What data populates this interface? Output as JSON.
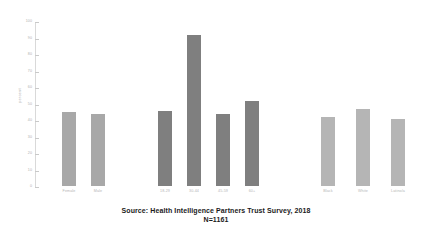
{
  "chart_data": {
    "type": "bar",
    "title": "",
    "subtitle": "",
    "xlabel": "",
    "ylabel": "percent",
    "ylim": [
      0,
      100
    ],
    "yticks": [
      0,
      10,
      20,
      30,
      40,
      50,
      60,
      70,
      80,
      90,
      100
    ],
    "ytick_labels": [
      "0",
      "10",
      "20",
      "30",
      "40",
      "50",
      "60",
      "70",
      "80",
      "90",
      "100"
    ],
    "grid": false,
    "legend": "none",
    "groups": [
      {
        "name": "gender",
        "color": "#a8a8a8",
        "categories": [
          "Female",
          "Male"
        ],
        "values": [
          45,
          44
        ]
      },
      {
        "name": "age",
        "color": "#7f7f7f",
        "categories": [
          "18-29",
          "30-44",
          "45-59",
          "60+"
        ],
        "values": [
          46,
          92,
          44,
          52
        ]
      },
      {
        "name": "race",
        "color": "#b5b5b5",
        "categories": [
          "Black",
          "White",
          "Latino/a"
        ],
        "values": [
          42,
          47,
          41
        ]
      }
    ],
    "categories": [
      "Female",
      "Male",
      "18-29",
      "30-44",
      "45-59",
      "60+",
      "Black",
      "White",
      "Latino/a"
    ],
    "values": [
      45,
      44,
      46,
      92,
      44,
      52,
      42,
      47,
      41
    ]
  },
  "footer": {
    "source": "Source: Health Intelligence Partners Trust Survey, 2018",
    "sample_size": "N=1161"
  }
}
